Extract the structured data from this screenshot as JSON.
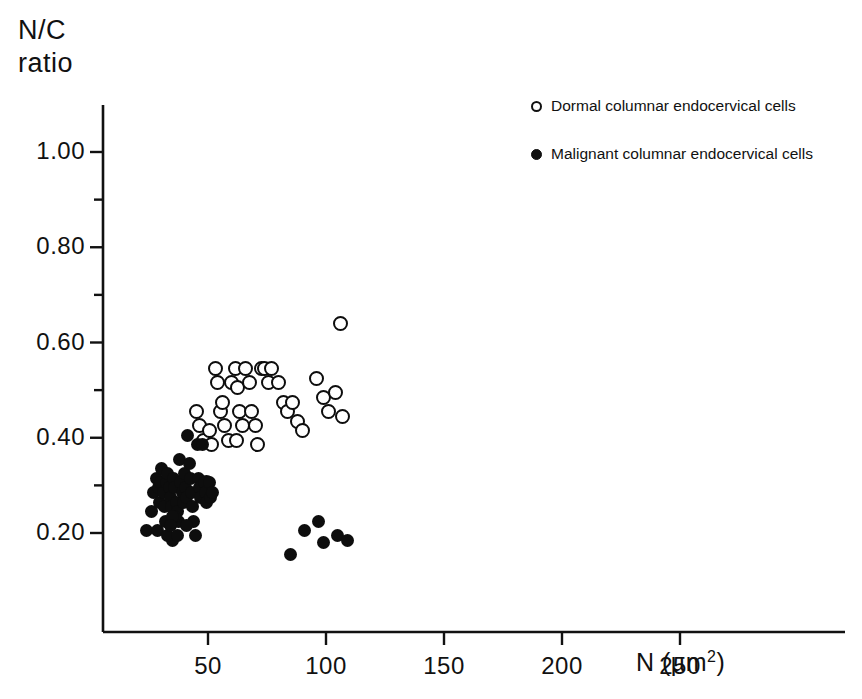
{
  "chart_data": {
    "type": "scatter",
    "title": "",
    "xlabel": "N (µm2)",
    "xlabel_base": "N (µm",
    "xlabel_sup": "2",
    "xlabel_close": ")",
    "ylabel": "N/C\nratio",
    "ylabel_line1": "N/C",
    "ylabel_line2": "ratio",
    "xlim": [
      0,
      275
    ],
    "ylim": [
      0.0,
      1.08
    ],
    "grid": false,
    "legend_position": "top-right",
    "x_ticks": [
      50,
      100,
      150,
      200,
      250
    ],
    "x_tick_labels": [
      "50",
      "100",
      "150",
      "200",
      "250"
    ],
    "y_ticks": [
      0.2,
      0.4,
      0.6,
      0.8,
      1.0
    ],
    "y_tick_labels": [
      "0.20",
      "0.40",
      "0.60",
      "0.80",
      "1.00"
    ],
    "y_minor_ticks": [
      0.3,
      0.5,
      0.7,
      0.9
    ],
    "series": [
      {
        "name": "Dormal columnar endocervical cells",
        "marker": "open-circle",
        "color": "#0d0d0d",
        "points": [
          [
            45.0,
            0.455
          ],
          [
            46.5,
            0.425
          ],
          [
            48.0,
            0.395
          ],
          [
            50.5,
            0.415
          ],
          [
            51.5,
            0.385
          ],
          [
            49.5,
            0.305
          ],
          [
            53.0,
            0.545
          ],
          [
            54.0,
            0.515
          ],
          [
            55.5,
            0.455
          ],
          [
            57.0,
            0.425
          ],
          [
            58.5,
            0.395
          ],
          [
            56.0,
            0.475
          ],
          [
            60.0,
            0.515
          ],
          [
            61.5,
            0.545
          ],
          [
            62.5,
            0.505
          ],
          [
            63.5,
            0.455
          ],
          [
            64.5,
            0.425
          ],
          [
            62.0,
            0.395
          ],
          [
            66.0,
            0.545
          ],
          [
            67.5,
            0.515
          ],
          [
            68.5,
            0.455
          ],
          [
            70.0,
            0.425
          ],
          [
            71.0,
            0.385
          ],
          [
            72.5,
            0.545
          ],
          [
            74.0,
            0.545
          ],
          [
            75.5,
            0.515
          ],
          [
            77.0,
            0.545
          ],
          [
            80.0,
            0.515
          ],
          [
            82.0,
            0.475
          ],
          [
            83.5,
            0.455
          ],
          [
            86.0,
            0.475
          ],
          [
            88.0,
            0.435
          ],
          [
            90.0,
            0.415
          ],
          [
            96.0,
            0.525
          ],
          [
            99.0,
            0.485
          ],
          [
            101.0,
            0.455
          ],
          [
            104.0,
            0.495
          ],
          [
            107.0,
            0.445
          ],
          [
            106.0,
            0.64
          ]
        ]
      },
      {
        "name": "Malignant columnar endocervical cells",
        "marker": "filled-circle",
        "color": "#0d0d0d",
        "points": [
          [
            24.0,
            0.205
          ],
          [
            26.0,
            0.245
          ],
          [
            27.0,
            0.285
          ],
          [
            28.0,
            0.315
          ],
          [
            29.0,
            0.295
          ],
          [
            29.5,
            0.265
          ],
          [
            30.0,
            0.305
          ],
          [
            30.5,
            0.335
          ],
          [
            31.0,
            0.285
          ],
          [
            31.5,
            0.255
          ],
          [
            32.0,
            0.225
          ],
          [
            32.5,
            0.305
          ],
          [
            33.0,
            0.325
          ],
          [
            33.5,
            0.295
          ],
          [
            34.0,
            0.275
          ],
          [
            34.5,
            0.255
          ],
          [
            35.0,
            0.185
          ],
          [
            35.5,
            0.315
          ],
          [
            36.0,
            0.295
          ],
          [
            36.5,
            0.265
          ],
          [
            37.0,
            0.245
          ],
          [
            37.5,
            0.225
          ],
          [
            38.0,
            0.355
          ],
          [
            38.5,
            0.305
          ],
          [
            39.0,
            0.285
          ],
          [
            39.5,
            0.265
          ],
          [
            40.0,
            0.325
          ],
          [
            40.5,
            0.295
          ],
          [
            41.0,
            0.275
          ],
          [
            41.5,
            0.405
          ],
          [
            42.0,
            0.345
          ],
          [
            42.5,
            0.315
          ],
          [
            43.0,
            0.285
          ],
          [
            43.5,
            0.255
          ],
          [
            44.0,
            0.225
          ],
          [
            44.5,
            0.195
          ],
          [
            45.5,
            0.385
          ],
          [
            46.0,
            0.315
          ],
          [
            46.5,
            0.295
          ],
          [
            47.0,
            0.275
          ],
          [
            47.5,
            0.385
          ],
          [
            48.5,
            0.305
          ],
          [
            49.0,
            0.285
          ],
          [
            49.5,
            0.265
          ],
          [
            50.5,
            0.305
          ],
          [
            51.0,
            0.275
          ],
          [
            52.0,
            0.285
          ],
          [
            28.5,
            0.205
          ],
          [
            33.0,
            0.195
          ],
          [
            37.0,
            0.195
          ],
          [
            41.0,
            0.215
          ],
          [
            36.0,
            0.235
          ],
          [
            35.0,
            0.235
          ],
          [
            34.0,
            0.215
          ],
          [
            85.0,
            0.155
          ],
          [
            91.0,
            0.205
          ],
          [
            97.0,
            0.225
          ],
          [
            99.0,
            0.18
          ],
          [
            105.0,
            0.195
          ],
          [
            109.0,
            0.185
          ]
        ]
      }
    ]
  },
  "axes_geometry": {
    "plot_left": 103,
    "plot_right": 845,
    "plot_top": 105,
    "plot_bottom": 632,
    "x_px_at_50": 208,
    "x_px_at_100": 326,
    "y_px_at_020": 533,
    "y_px_at_100": 152
  },
  "legend": {
    "items": [
      {
        "marker": "open-circle",
        "label": "Dormal columnar endocervical cells"
      },
      {
        "marker": "filled-circle",
        "label": "Malignant columnar endocervical cells"
      }
    ]
  }
}
